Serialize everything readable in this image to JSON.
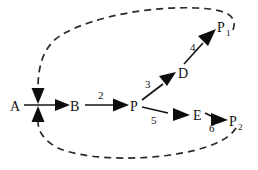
{
  "diagram": {
    "type": "node-link-diagram",
    "width": 258,
    "height": 170,
    "background_color": "#ffffff",
    "stroke_color": "#141414",
    "dashed_color": "#2a2a2a"
  },
  "nodes": [
    {
      "id": "A",
      "label": "A",
      "sub": "",
      "x": 15,
      "y": 105
    },
    {
      "id": "B",
      "label": "B",
      "sub": "",
      "x": 76,
      "y": 105
    },
    {
      "id": "P",
      "label": "P",
      "sub": "",
      "x": 135,
      "y": 105
    },
    {
      "id": "D",
      "label": "D",
      "sub": "",
      "x": 183,
      "y": 73
    },
    {
      "id": "E",
      "label": "E",
      "sub": "",
      "x": 198,
      "y": 115
    },
    {
      "id": "P1",
      "label": "P",
      "sub": "1",
      "x": 222,
      "y": 27
    },
    {
      "id": "P2",
      "label": "P",
      "sub": "2",
      "x": 234,
      "y": 120
    }
  ],
  "edges": [
    {
      "id": "A-B",
      "from": "A",
      "to": "B",
      "label": "",
      "style": "solid"
    },
    {
      "id": "B-P",
      "from": "B",
      "to": "P",
      "label": "2",
      "style": "solid",
      "label_x": 101,
      "label_y": 96
    },
    {
      "id": "P-D",
      "from": "P",
      "to": "D",
      "label": "3",
      "style": "solid",
      "label_x": 148,
      "label_y": 86
    },
    {
      "id": "P-E",
      "from": "P",
      "to": "E",
      "label": "5",
      "style": "solid",
      "label_x": 154,
      "label_y": 122
    },
    {
      "id": "D-P1",
      "from": "D",
      "to": "P1",
      "label": "4",
      "style": "solid",
      "label_x": 194,
      "label_y": 48
    },
    {
      "id": "E-P2",
      "from": "E",
      "to": "P2",
      "label": "6",
      "style": "solid",
      "label_x": 212,
      "label_y": 130
    },
    {
      "id": "P1-A",
      "from": "P1",
      "to": "A",
      "label": "",
      "style": "dashed"
    },
    {
      "id": "P2-A",
      "from": "P2",
      "to": "A",
      "label": "",
      "style": "dashed"
    }
  ],
  "edge_labels": {
    "b_to_p": "2",
    "p_to_d": "3",
    "d_to_p1": "4",
    "p_to_e": "5",
    "e_to_p2": "6"
  },
  "node_labels": {
    "a": "A",
    "b": "B",
    "p": "P",
    "d": "D",
    "e": "E",
    "p1": "P",
    "p1_sub": "1",
    "p2": "P",
    "p2_sub": "2"
  }
}
